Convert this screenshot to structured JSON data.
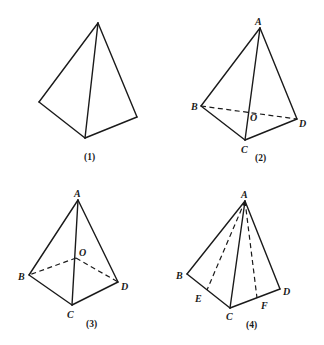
{
  "figures": [
    {
      "caption": "(1)",
      "vertices": {},
      "solid_edges": [
        "apex-left",
        "apex-bottom",
        "apex-right",
        "left-bottom",
        "bottom-right"
      ],
      "dashed_edges": []
    },
    {
      "caption": "(2)",
      "vertices": {
        "A": "A",
        "B": "B",
        "C": "C",
        "D": "D",
        "O": "O"
      },
      "solid_edges": [
        "AB",
        "AC",
        "AD",
        "BC",
        "CD"
      ],
      "dashed_edges": [
        "BD"
      ]
    },
    {
      "caption": "(3)",
      "vertices": {
        "A": "A",
        "B": "B",
        "C": "C",
        "D": "D",
        "O": "O"
      },
      "solid_edges": [
        "AB",
        "AC",
        "AD",
        "BC",
        "CD"
      ],
      "dashed_edges": [
        "OB",
        "OD"
      ]
    },
    {
      "caption": "(4)",
      "vertices": {
        "A": "A",
        "B": "B",
        "C": "C",
        "D": "D",
        "E": "E",
        "F": "F"
      },
      "solid_edges": [
        "AB",
        "AC",
        "AD",
        "BC",
        "CD"
      ],
      "dashed_edges": [
        "AE",
        "AF"
      ]
    }
  ]
}
